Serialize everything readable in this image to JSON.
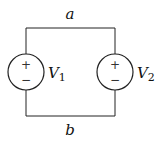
{
  "diagram": {
    "type": "circuit",
    "nodes": {
      "top": {
        "label": "a"
      },
      "bottom": {
        "label": "b"
      }
    },
    "sources": [
      {
        "name": "V",
        "subscript": "1",
        "plus": "+",
        "minus": "−",
        "position": "left"
      },
      {
        "name": "V",
        "subscript": "2",
        "plus": "+",
        "minus": "−",
        "position": "right"
      }
    ],
    "colors": {
      "stroke": "#222222",
      "background": "#ffffff"
    }
  }
}
